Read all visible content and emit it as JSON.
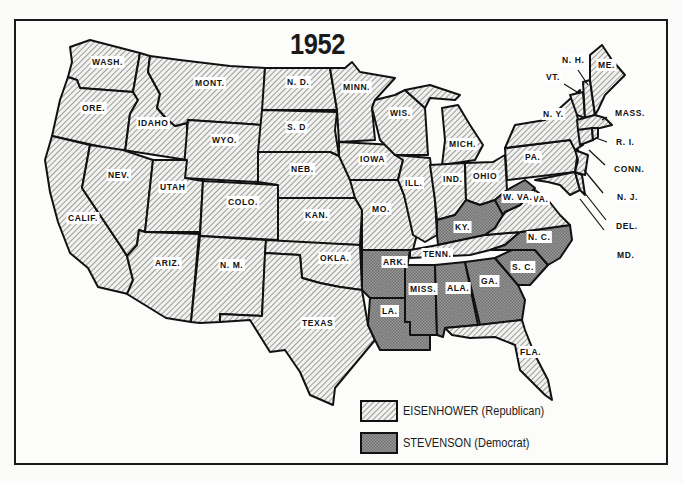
{
  "title": "1952",
  "legend": {
    "republican": {
      "label": "EISENHOWER (Republican)",
      "pattern": "diagonal-hatch",
      "color": "#e8e8e6"
    },
    "democrat": {
      "label": "STEVENSON (Democrat)",
      "pattern": "crosshatch-dark",
      "color": "#8f8f8f"
    }
  },
  "states": {
    "WASH": {
      "label": "WASH.",
      "winner": "republican"
    },
    "ORE": {
      "label": "ORE.",
      "winner": "republican"
    },
    "CALIF": {
      "label": "CALIF.",
      "winner": "republican"
    },
    "IDAHO": {
      "label": "IDAHO",
      "winner": "republican"
    },
    "NEV": {
      "label": "NEV.",
      "winner": "republican"
    },
    "MONT": {
      "label": "MONT.",
      "winner": "republican"
    },
    "WYO": {
      "label": "WYO.",
      "winner": "republican"
    },
    "UTAH": {
      "label": "UTAH",
      "winner": "republican"
    },
    "ARIZ": {
      "label": "ARIZ.",
      "winner": "republican"
    },
    "COLO": {
      "label": "COLO.",
      "winner": "republican"
    },
    "NM": {
      "label": "N. M.",
      "winner": "republican"
    },
    "ND": {
      "label": "N. D.",
      "winner": "republican"
    },
    "SD": {
      "label": "S. D",
      "winner": "republican"
    },
    "NEB": {
      "label": "NEB.",
      "winner": "republican"
    },
    "KAN": {
      "label": "KAN.",
      "winner": "republican"
    },
    "OKLA": {
      "label": "OKLA.",
      "winner": "republican"
    },
    "TEXAS": {
      "label": "TEXAS",
      "winner": "republican"
    },
    "MINN": {
      "label": "MINN.",
      "winner": "republican"
    },
    "IOWA": {
      "label": "IOWA",
      "winner": "republican"
    },
    "MO": {
      "label": "MO.",
      "winner": "republican"
    },
    "ARK": {
      "label": "ARK.",
      "winner": "democrat"
    },
    "LA": {
      "label": "LA.",
      "winner": "democrat"
    },
    "WIS": {
      "label": "WIS.",
      "winner": "republican"
    },
    "ILL": {
      "label": "ILL.",
      "winner": "republican"
    },
    "MICH": {
      "label": "MICH.",
      "winner": "republican"
    },
    "IND": {
      "label": "IND.",
      "winner": "republican"
    },
    "OHIO": {
      "label": "OHIO",
      "winner": "republican"
    },
    "KY": {
      "label": "KY.",
      "winner": "democrat"
    },
    "TENN": {
      "label": "TENN.",
      "winner": "republican"
    },
    "MISS": {
      "label": "MISS.",
      "winner": "democrat"
    },
    "ALA": {
      "label": "ALA.",
      "winner": "democrat"
    },
    "GA": {
      "label": "GA.",
      "winner": "democrat"
    },
    "FLA": {
      "label": "FLA.",
      "winner": "republican"
    },
    "SC": {
      "label": "S. C.",
      "winner": "democrat"
    },
    "NC": {
      "label": "N. C.",
      "winner": "democrat"
    },
    "VA": {
      "label": "VA.",
      "winner": "republican"
    },
    "WVA": {
      "label": "W. VA.",
      "winner": "democrat"
    },
    "PA": {
      "label": "PA.",
      "winner": "republican"
    },
    "NY": {
      "label": "N. Y.",
      "winner": "republican"
    },
    "VT": {
      "label": "VT.",
      "winner": "republican"
    },
    "NH": {
      "label": "N. H.",
      "winner": "republican"
    },
    "ME": {
      "label": "ME.",
      "winner": "republican"
    },
    "MASS": {
      "label": "MASS.",
      "winner": "republican"
    },
    "RI": {
      "label": "R. I.",
      "winner": "republican"
    },
    "CONN": {
      "label": "CONN.",
      "winner": "republican"
    },
    "NJ": {
      "label": "N. J.",
      "winner": "republican"
    },
    "DEL": {
      "label": "DEL.",
      "winner": "republican"
    },
    "MD": {
      "label": "MD.",
      "winner": "republican"
    }
  }
}
